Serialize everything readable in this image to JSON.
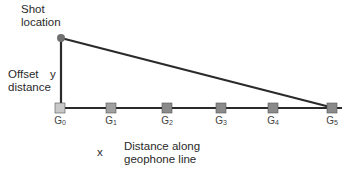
{
  "labels": {
    "shot_location": [
      "Shot",
      "location"
    ],
    "offset_distance": [
      "Offset",
      "distance"
    ],
    "y_symbol": "y",
    "x_symbol": "x",
    "distance_along": [
      "Distance along",
      "geophone line"
    ]
  },
  "geophones": [
    {
      "base": "G",
      "index": "0",
      "x": 60,
      "fill": "#c8c8c8"
    },
    {
      "base": "G",
      "index": "1",
      "x": 111,
      "fill": "#a0a0a0"
    },
    {
      "base": "G",
      "index": "2",
      "x": 167,
      "fill": "#8a8a8a"
    },
    {
      "base": "G",
      "index": "3",
      "x": 221,
      "fill": "#8a8a8a"
    },
    {
      "base": "G",
      "index": "4",
      "x": 273,
      "fill": "#8a8a8a"
    },
    {
      "base": "G",
      "index": "5",
      "x": 332,
      "fill": "#8a8a8a"
    }
  ],
  "colors": {
    "line": "#2a2a2a",
    "shot_point": "#707070"
  }
}
